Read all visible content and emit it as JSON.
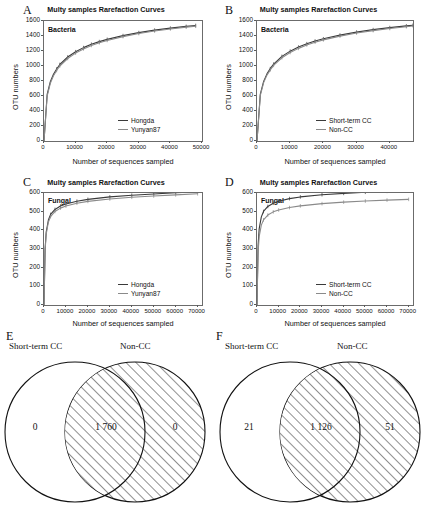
{
  "figure": {
    "panels": [
      "A",
      "B",
      "C",
      "D",
      "E",
      "F"
    ]
  },
  "chart_data": [
    {
      "panel": "A",
      "type": "line",
      "title": "Multy samples Rarefaction Curves",
      "annotation": "Bacteria",
      "xlabel": "Number of sequences sampled",
      "ylabel": "OTU numbers",
      "xlim": [
        0,
        50000
      ],
      "ylim": [
        0,
        1600
      ],
      "xticks": [
        0,
        10000,
        20000,
        30000,
        40000,
        50000
      ],
      "yticks": [
        0,
        200,
        400,
        600,
        800,
        1000,
        1200,
        1400,
        1600
      ],
      "grid": false,
      "legend_position": "bottom-right",
      "series": [
        {
          "name": "Hongda",
          "color": "#3a3a3a",
          "x": [
            0,
            1000,
            2000,
            3000,
            4000,
            5000,
            7500,
            10000,
            12500,
            15000,
            17500,
            20000,
            25000,
            30000,
            35000,
            40000,
            45000,
            48000
          ],
          "values": [
            0,
            620,
            790,
            890,
            960,
            1020,
            1120,
            1190,
            1245,
            1290,
            1325,
            1355,
            1405,
            1445,
            1478,
            1505,
            1528,
            1540
          ]
        },
        {
          "name": "Yunyan87",
          "color": "#8a8a8a",
          "x": [
            0,
            1000,
            2000,
            3000,
            4000,
            5000,
            7500,
            10000,
            12500,
            15000,
            17500,
            20000,
            25000,
            30000,
            35000,
            40000,
            45000,
            48000
          ],
          "values": [
            0,
            600,
            770,
            870,
            940,
            1000,
            1100,
            1172,
            1228,
            1274,
            1310,
            1341,
            1392,
            1433,
            1466,
            1494,
            1518,
            1530
          ]
        }
      ]
    },
    {
      "panel": "B",
      "type": "line",
      "title": "Multy samples Rarefaction Curves",
      "annotation": "Bacteria",
      "xlabel": "Number of sequences sampled",
      "ylabel": "OTU numbers",
      "xlim": [
        0,
        47000
      ],
      "ylim": [
        0,
        1600
      ],
      "xticks": [
        0,
        10000,
        20000,
        30000,
        40000
      ],
      "yticks": [
        0,
        200,
        400,
        600,
        800,
        1000,
        1200,
        1400,
        1600
      ],
      "grid": false,
      "legend_position": "bottom-right",
      "series": [
        {
          "name": "Short-term CC",
          "color": "#3a3a3a",
          "x": [
            0,
            1000,
            2000,
            3000,
            4000,
            5000,
            7500,
            10000,
            12500,
            15000,
            17500,
            20000,
            25000,
            30000,
            35000,
            40000,
            45000,
            47000
          ],
          "values": [
            0,
            625,
            795,
            895,
            965,
            1025,
            1128,
            1198,
            1252,
            1297,
            1333,
            1363,
            1412,
            1452,
            1485,
            1512,
            1535,
            1544
          ]
        },
        {
          "name": "Non-CC",
          "color": "#8a8a8a",
          "x": [
            0,
            1000,
            2000,
            3000,
            4000,
            5000,
            7500,
            10000,
            12500,
            15000,
            17500,
            20000,
            25000,
            30000,
            35000,
            40000,
            45000,
            47000
          ],
          "values": [
            0,
            608,
            778,
            878,
            948,
            1008,
            1110,
            1180,
            1235,
            1281,
            1317,
            1348,
            1398,
            1439,
            1472,
            1500,
            1524,
            1534
          ]
        }
      ]
    },
    {
      "panel": "C",
      "type": "line",
      "title": "Multy samples Rarefaction Curves",
      "annotation": "Fungal",
      "xlabel": "Number of sequences sampled",
      "ylabel": "OTU numbers",
      "xlim": [
        0,
        72000
      ],
      "ylim": [
        0,
        600
      ],
      "xticks": [
        0,
        10000,
        20000,
        30000,
        40000,
        50000,
        60000,
        70000
      ],
      "yticks": [
        0,
        100,
        200,
        300,
        400,
        500,
        600
      ],
      "grid": false,
      "legend_position": "bottom-right",
      "series": [
        {
          "name": "Hongda",
          "color": "#3a3a3a",
          "x": [
            0,
            500,
            1000,
            2000,
            3000,
            5000,
            7500,
            10000,
            15000,
            20000,
            30000,
            40000,
            50000,
            60000,
            70000
          ],
          "values": [
            0,
            300,
            390,
            455,
            485,
            512,
            530,
            541,
            556,
            566,
            579,
            588,
            595,
            601,
            607
          ]
        },
        {
          "name": "Yunyan87",
          "color": "#8a8a8a",
          "x": [
            0,
            500,
            1000,
            2000,
            3000,
            5000,
            7500,
            10000,
            15000,
            20000,
            30000,
            40000,
            50000,
            60000,
            70000
          ],
          "values": [
            0,
            292,
            380,
            445,
            474,
            501,
            519,
            530,
            545,
            555,
            568,
            577,
            584,
            590,
            596
          ]
        }
      ]
    },
    {
      "panel": "D",
      "type": "line",
      "title": "Multy samples Rarefaction Curves",
      "annotation": "Fungal",
      "xlabel": "Number of sequences sampled",
      "ylabel": "OTU numbers",
      "xlim": [
        0,
        72000
      ],
      "ylim": [
        0,
        600
      ],
      "xticks": [
        0,
        10000,
        20000,
        30000,
        40000,
        50000,
        60000,
        70000
      ],
      "yticks": [
        0,
        100,
        200,
        300,
        400,
        500,
        600
      ],
      "grid": false,
      "legend_position": "bottom-right",
      "series": [
        {
          "name": "Short-term CC",
          "color": "#3a3a3a",
          "x": [
            0,
            500,
            1000,
            2000,
            3000,
            5000,
            7500,
            10000,
            15000,
            20000,
            30000,
            40000,
            50000,
            60000,
            70000
          ],
          "values": [
            0,
            318,
            408,
            472,
            501,
            528,
            545,
            556,
            570,
            579,
            591,
            598,
            604,
            609,
            613
          ]
        },
        {
          "name": "Non-CC",
          "color": "#8a8a8a",
          "x": [
            0,
            500,
            1000,
            2000,
            3000,
            5000,
            7500,
            10000,
            15000,
            20000,
            30000,
            40000,
            50000,
            60000,
            70000
          ],
          "values": [
            0,
            282,
            366,
            428,
            456,
            482,
            499,
            509,
            522,
            531,
            543,
            551,
            557,
            562,
            566
          ]
        }
      ]
    },
    {
      "panel": "E",
      "type": "venn",
      "set_labels": [
        "Short-term CC",
        "Non-CC"
      ],
      "left_only": "0",
      "intersection": "1 760",
      "right_only": "0"
    },
    {
      "panel": "F",
      "type": "venn",
      "set_labels": [
        "Short-term CC",
        "Non-CC"
      ],
      "left_only": "21",
      "intersection": "1 126",
      "right_only": "51"
    }
  ]
}
